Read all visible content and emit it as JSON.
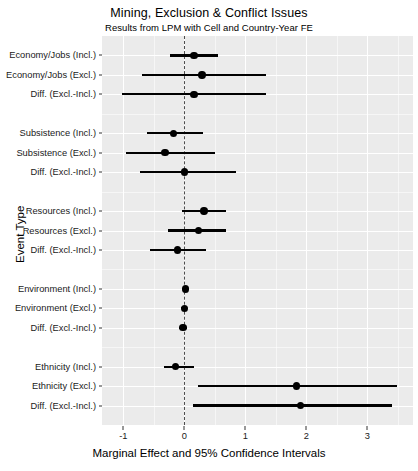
{
  "chart_data": {
    "type": "scatter",
    "title": "Mining, Exclusion & Conflict Issues",
    "subtitle": "Results from LPM with Cell and Country-Year FE",
    "xlabel": "Marginal Effect and 95% Confidence Intervals",
    "ylabel": "Event Type",
    "xlim": [
      -1.35,
      3.75
    ],
    "xticks": [
      -1,
      0,
      1,
      2,
      3
    ],
    "xticklabels": [
      "-1",
      "0",
      "1",
      "2",
      "3"
    ],
    "grid": true,
    "legend": null,
    "reference_line": 0,
    "categories": [
      "Economy/Jobs (Incl.)",
      "Economy/Jobs (Excl.)",
      "Diff. (Excl.-Incl.)",
      "",
      "Subsistence (Incl.)",
      "Subsistence (Excl.)",
      "Diff. (Excl.-Incl.)",
      "",
      "Resources (Incl.)",
      "Resources (Excl.)",
      "Diff. (Excl.-Incl.)",
      "",
      "Environment (Incl.)",
      "Environment (Excl.)",
      "Diff. (Excl.-Incl.)",
      "",
      "Ethnicity (Incl.)",
      "Ethnicity (Excl.)",
      "Diff. (Excl.-Incl.)"
    ],
    "points": [
      {
        "label": "Economy/Jobs (Incl.)",
        "estimate": 0.16,
        "low": -0.23,
        "high": 0.55
      },
      {
        "label": "Economy/Jobs (Excl.)",
        "estimate": 0.29,
        "low": -0.7,
        "high": 1.34
      },
      {
        "label": "Diff. (Excl.-Incl.)",
        "estimate": 0.16,
        "low": -1.02,
        "high": 1.34
      },
      {
        "label": "Subsistence (Incl.)",
        "estimate": -0.18,
        "low": -0.61,
        "high": 0.3
      },
      {
        "label": "Subsistence (Excl.)",
        "estimate": -0.32,
        "low": -0.96,
        "high": 0.5
      },
      {
        "label": "Diff. (Excl.-Incl.)",
        "estimate": 0.0,
        "low": -0.73,
        "high": 0.84
      },
      {
        "label": "Resources (Incl.)",
        "estimate": 0.32,
        "low": -0.04,
        "high": 0.68
      },
      {
        "label": "Resources (Excl.)",
        "estimate": 0.23,
        "low": -0.27,
        "high": 0.68
      },
      {
        "label": "Diff. (Excl.-Incl.)",
        "estimate": -0.11,
        "low": -0.57,
        "high": 0.36
      },
      {
        "label": "Environment (Incl.)",
        "estimate": 0.02,
        "low": -0.03,
        "high": 0.07
      },
      {
        "label": "Environment (Excl.)",
        "estimate": 0.0,
        "low": -0.05,
        "high": 0.05
      },
      {
        "label": "Diff. (Excl.-Incl.)",
        "estimate": -0.02,
        "low": -0.08,
        "high": 0.04
      },
      {
        "label": "Ethnicity (Incl.)",
        "estimate": -0.14,
        "low": -0.34,
        "high": 0.16
      },
      {
        "label": "Ethnicity (Excl.)",
        "estimate": 1.84,
        "low": 0.23,
        "high": 3.48
      },
      {
        "label": "Diff. (Excl.-Incl.)",
        "estimate": 1.91,
        "low": 0.14,
        "high": 3.41
      }
    ]
  },
  "colors": {
    "panel": "#EBEBEB",
    "grid": "#FFFFFF",
    "point": "#000000",
    "reference": "#4D4D4D",
    "text": "#000000"
  }
}
